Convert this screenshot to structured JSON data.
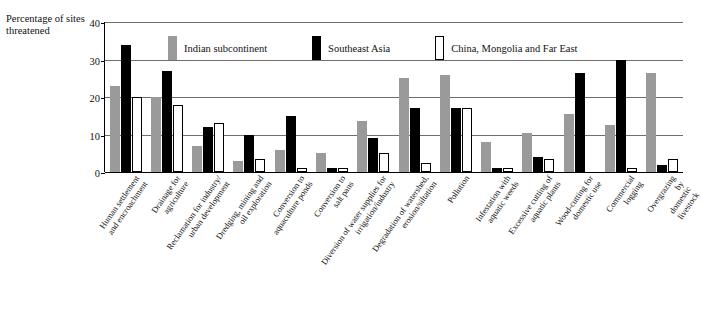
{
  "chart_data": {
    "type": "bar",
    "title": "",
    "subtitle": "",
    "ylabel": "Percentage of sites threatened",
    "xlabel": "",
    "ylim": [
      0,
      40
    ],
    "yticks": [
      0,
      10,
      20,
      30,
      40
    ],
    "grid": true,
    "legend_position": "top",
    "categories": [
      "Human settlement and encroachment",
      "Drainage for agriculture",
      "Reclamation for industry/ urban development",
      "Dredging, mining and oil exploration",
      "Conversion to aquaculture ponds",
      "Conversion to salt pans",
      "Diversion of water supplies for irrigation/industry",
      "Degradation of watershed, erosion/siltation",
      "Pollution",
      "Infestation with aquatic weeds",
      "Excessive cutting of aquatic plants",
      "Wood-cutting for domestic use",
      "Commercial logging",
      "Overgrazing by domestic livestock"
    ],
    "category_lines": [
      [
        "Human settlement",
        "and encroachment"
      ],
      [
        "Drainage for",
        "agriculture"
      ],
      [
        "Reclamation for industry/",
        "urban development"
      ],
      [
        "Dredging, mining and",
        "oil exploration"
      ],
      [
        "Conversion to",
        "aquaculture ponds"
      ],
      [
        "Conversion to",
        "salt pans"
      ],
      [
        "Diversion of water supplies for",
        "irrigation/industry"
      ],
      [
        "Degradation of watershed,",
        "erosion/siltation"
      ],
      [
        "Pollution"
      ],
      [
        "Infestation with",
        "aquatic weeds"
      ],
      [
        "Excessive cutting of",
        "aquatic plants"
      ],
      [
        "Wood-cutting for",
        "domestic use"
      ],
      [
        "Commercial",
        "logging"
      ],
      [
        "Overgrazing by",
        "domestic livestock"
      ]
    ],
    "series": [
      {
        "name": "Indian subcontinent",
        "color": "#9a9a9a",
        "values": [
          23,
          20,
          7,
          3,
          6,
          5,
          13.5,
          25,
          26,
          8,
          10.5,
          15.5,
          12.5,
          26.5
        ]
      },
      {
        "name": "Southeast Asia",
        "color": "#000000",
        "values": [
          34,
          27,
          12,
          10,
          15,
          1,
          9,
          17,
          17,
          1,
          4,
          26.5,
          30,
          2
        ]
      },
      {
        "name": "China, Mongolia and Far East",
        "color": "#ffffff",
        "values": [
          20,
          18,
          13,
          3.5,
          1,
          1,
          5,
          2.5,
          17,
          1,
          3.5,
          0,
          1,
          3.5
        ]
      }
    ]
  },
  "legend": {
    "items": [
      {
        "label": "Indian subcontinent",
        "swatch": "gray-swatch-icon"
      },
      {
        "label": "Southeast Asia",
        "swatch": "black-swatch-icon"
      },
      {
        "label": "China, Mongolia and Far East",
        "swatch": "white-swatch-icon"
      }
    ]
  },
  "axis": {
    "y_title_lines": [
      "Percentage",
      "of sites",
      "threatened"
    ],
    "y_ticks": [
      "40",
      "30",
      "20",
      "10",
      "0"
    ]
  }
}
